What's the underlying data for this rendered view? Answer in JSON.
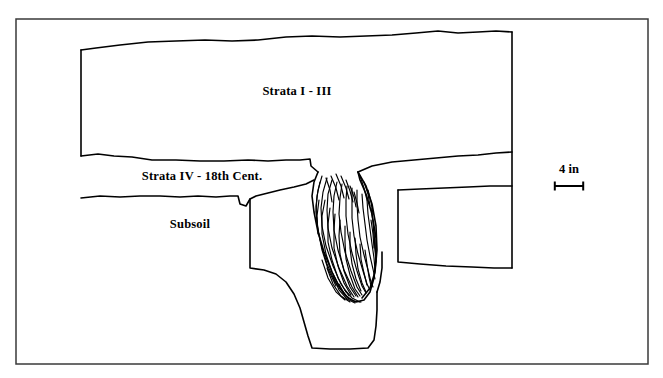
{
  "figure": {
    "type": "archaeological-stratigraphic-profile",
    "background_color": "#ffffff",
    "line_color": "#000000",
    "frame_color": "#3a3a3a"
  },
  "labels": {
    "upper_strata": "Strata I - III",
    "middle_stratum": "Strata IV - 18th Cent.",
    "lower_stratum": "Subsoil"
  },
  "scale": {
    "value": "4 in"
  },
  "label_positions": {
    "upper_strata": {
      "x": 297,
      "y": 92
    },
    "middle_stratum": {
      "x": 202,
      "y": 177
    },
    "lower_stratum": {
      "x": 190,
      "y": 225
    },
    "scale_text": {
      "x": 569,
      "y": 170
    }
  },
  "geometry": {
    "frame": {
      "x": 16,
      "y": 19,
      "width": 632,
      "height": 345
    },
    "scale_bar": {
      "x1": 554,
      "x2": 584,
      "y": 186,
      "cap_height": 9
    },
    "ground_surface": "M 81,50 L 96,48 L 120,45 L 148,42 L 176,41 L 205,40 L 232,41 L 258,40 L 286,37 L 312,36 L 340,37 L 366,36 L 392,35 L 416,33 L 438,31 L 458,33 L 478,32 L 496,31 L 512,32",
    "left_edge_upper": "M 81,50 L 81,156",
    "right_edge": "M 512,32 L 512,268",
    "strata_iv_top_left": "M 81,156 L 98,154 L 114,156 L 132,157 L 152,160 L 176,160 L 200,161 L 224,161 L 248,160 L 268,161 L 286,160 L 300,160 L 310,159 L 311,166 L 318,172",
    "strata_iv_top_right": "M 358,172 L 372,166 L 392,162 L 414,160 L 436,158 L 458,156 L 478,155 L 496,153 L 512,152",
    "strata_iv_bottom_left": "M 81,198 L 100,196 L 120,197 L 140,196 L 160,196 L 180,197 L 198,196 L 216,197 L 230,196 L 238,196 L 240,204 L 246,206 L 250,199 L 256,196 L 268,193 L 280,190 L 294,187 L 306,184 L 314,180",
    "strata_iv_bottom_right": "M 398,190 L 420,189 L 444,188 L 468,187 L 490,186 L 512,186",
    "lower_block_right": "M 398,190 L 398,262 L 420,264 L 446,266 L 472,267 L 494,268 L 512,268",
    "trench_left_wall": "M 250,199 L 250,268 L 264,270 L 276,274 L 286,282 L 294,294 L 300,308 L 304,322 L 308,336 L 312,348 L 330,349 L 350,349 L 368,348 L 374,340 L 376,326 L 377,310 L 377,292",
    "pit_outline_left": "M 318,172 L 314,182 L 312,196 L 314,212 L 318,232 L 324,252 L 332,272 L 340,288 L 348,298 L 356,302 L 364,300 L 370,292 L 374,278 L 376,260 L 376,238 L 372,214 L 366,194 L 360,180 L 358,172",
    "pit_inner_right": "M 358,172 L 366,186 L 372,204 L 376,226 L 377,250 L 375,272 L 370,288 L 362,298",
    "pit_base_right": "M 377,292 L 380,282 L 382,268 L 382,252",
    "hatch_strokes": [
      "M 322,176 L 318,190 L 316,206 L 317,224 L 321,244 L 327,264 L 335,282 L 344,294",
      "M 327,178 L 323,192 L 321,208 L 322,226 L 326,246 L 333,266 L 341,284 L 349,296",
      "M 332,180 L 328,194 L 327,210 L 328,228 L 332,248 L 339,268 L 347,286 L 354,297",
      "M 337,182 L 334,196 L 333,212 L 334,230 L 338,250 L 344,270 L 352,287 L 358,297",
      "M 342,184 L 340,198 L 339,214 L 341,232 L 345,252 L 351,271 L 357,287 L 362,295",
      "M 347,186 L 346,200 L 346,216 L 348,234 L 352,253 L 357,271 L 362,286 L 366,293",
      "M 352,188 L 352,202 L 352,218 L 354,236 L 358,254 L 363,271 L 367,284 L 370,290",
      "M 357,190 L 357,204 L 358,220 L 360,237 L 364,255 L 368,270 L 371,282 L 373,287",
      "M 362,194 L 363,208 L 365,224 L 367,240 L 370,256 L 373,269 L 375,279",
      "M 367,200 L 368,214 L 370,229 L 372,244 L 374,258 L 375,270",
      "M 371,208 L 373,222 L 374,236 L 375,250 L 376,262",
      "M 320,182 L 317,196 L 316,212 L 318,230 L 322,250 L 328,269 L 336,286",
      "M 325,200 L 322,216 L 322,234 L 326,254 L 332,272 L 340,288",
      "M 330,208 L 328,224 L 328,242 L 332,260 L 338,278 L 346,292",
      "M 335,214 L 334,230 L 334,248 L 338,266 L 344,283 L 351,295",
      "M 340,220 L 339,236 L 340,254 L 344,271 L 350,287 L 356,296",
      "M 345,226 L 345,242 L 346,259 L 350,275 L 355,289 L 360,296",
      "M 350,232 L 350,248 L 352,264 L 356,279 L 361,291",
      "M 355,238 L 356,254 L 358,269 L 362,283 L 366,292",
      "M 360,244 L 361,259 L 364,273 L 367,285",
      "M 365,250 L 367,264 L 369,277 L 371,286",
      "M 322,260 L 328,278 L 336,292 L 345,300",
      "M 327,268 L 333,284 L 341,296 L 350,302",
      "M 333,276 L 339,290 L 347,299 L 355,303",
      "M 339,284 L 345,295 L 353,301 L 361,302",
      "M 345,290 L 352,298 L 360,302",
      "M 326,178 L 330,190 L 332,202",
      "M 331,176 L 336,188 L 339,200",
      "M 336,174 L 341,186 L 344,198",
      "M 341,176 L 346,188 L 349,199",
      "M 346,180 L 350,191 L 353,202",
      "M 350,186 L 354,197 L 356,207",
      "M 354,192 L 357,203 L 359,213",
      "M 360,176 L 364,188 L 367,200",
      "M 364,182 L 368,194 L 370,206",
      "M 368,190 L 371,202 L 373,214",
      "M 319,200 L 317,216 L 318,234",
      "M 371,220 L 373,234 L 374,248",
      "M 374,232 L 375,246 L 376,258"
    ]
  }
}
